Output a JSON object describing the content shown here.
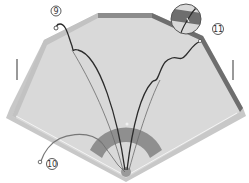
{
  "diagram": {
    "colors": {
      "background": "#ffffff",
      "field": "#d9d9d9",
      "field_outline": "#bdbdbd",
      "wall": "#8c8c8c",
      "wall_dark": "#5a5a5a",
      "infield_dirt": "#8f8f8f",
      "foul_line": "#f2f2f2",
      "trajectory": "#2b2b2b",
      "trajectory_light": "#6b6b6b",
      "callout": "#333333"
    },
    "callouts": [
      {
        "id": "9",
        "label": "9"
      },
      {
        "id": "10",
        "label": "10"
      },
      {
        "id": "11",
        "label": "11"
      }
    ]
  }
}
